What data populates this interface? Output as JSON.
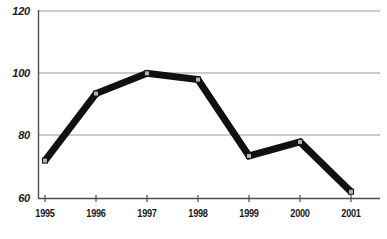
{
  "chart_data": {
    "type": "line",
    "title": "",
    "subtitle": "",
    "xlabel": "",
    "ylabel": "",
    "categories": [
      "1995",
      "1996",
      "1997",
      "1998",
      "1999",
      "2000",
      "2001"
    ],
    "values": [
      72,
      93.5,
      100,
      98,
      73.5,
      78,
      62
    ],
    "series": [
      {
        "name": "",
        "values": [
          72,
          93.5,
          100,
          98,
          73.5,
          78,
          62
        ]
      }
    ],
    "ylim": [
      60,
      120
    ],
    "xlim": [
      "1995",
      "2001"
    ],
    "y_ticks": [
      60,
      80,
      100,
      120
    ],
    "y_tick_labels": [
      "60",
      "80",
      "100",
      "120"
    ],
    "x_tick_labels": [
      "1995",
      "1996",
      "1997",
      "1998",
      "1999",
      "2000",
      "2001"
    ],
    "grid": true,
    "grid_axis": "y",
    "legend": false,
    "legend_position": "none",
    "marker": "square",
    "line_color": "#111111",
    "line_width_px": 7,
    "marker_face_color": "#b5b5b5",
    "marker_edge_color": "#111111",
    "grid_color": "#9a9a9a",
    "axis_color": "#4d4d4d",
    "background_color": "#ffffff",
    "annotations": []
  },
  "axes": {
    "y_labels": [
      "120",
      "100",
      "80",
      "60"
    ],
    "x_labels": [
      "1995",
      "1996",
      "1997",
      "1998",
      "1999",
      "2000",
      "2001"
    ]
  }
}
